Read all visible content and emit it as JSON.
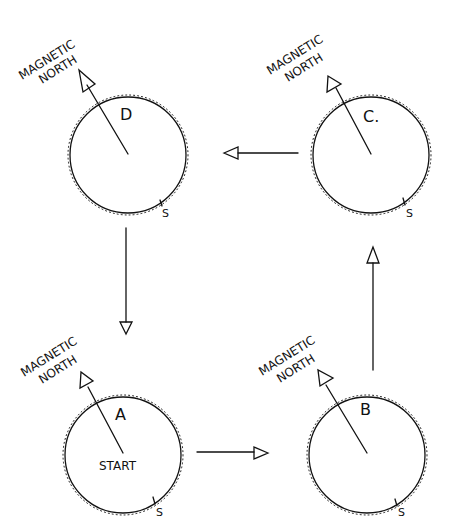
{
  "diagram": {
    "compasses": [
      {
        "id": "D",
        "label": "D",
        "north_label_1": "MAGNETIC",
        "north_label_2": "NORTH",
        "south_label": "S"
      },
      {
        "id": "C",
        "label": "C.",
        "north_label_1": "MAGNETIC",
        "north_label_2": "NORTH",
        "south_label": "S"
      },
      {
        "id": "A",
        "label": "A",
        "center_label": "START",
        "north_label_1": "MAGNETIC",
        "north_label_2": "NORTH",
        "south_label": "S"
      },
      {
        "id": "B",
        "label": "B",
        "north_label_1": "MAGNETIC",
        "north_label_2": "NORTH",
        "south_label": "S"
      }
    ],
    "path": [
      "A",
      "B",
      "C",
      "D",
      "A"
    ],
    "colors": {
      "ink": "#111111",
      "paper": "#ffffff"
    }
  }
}
